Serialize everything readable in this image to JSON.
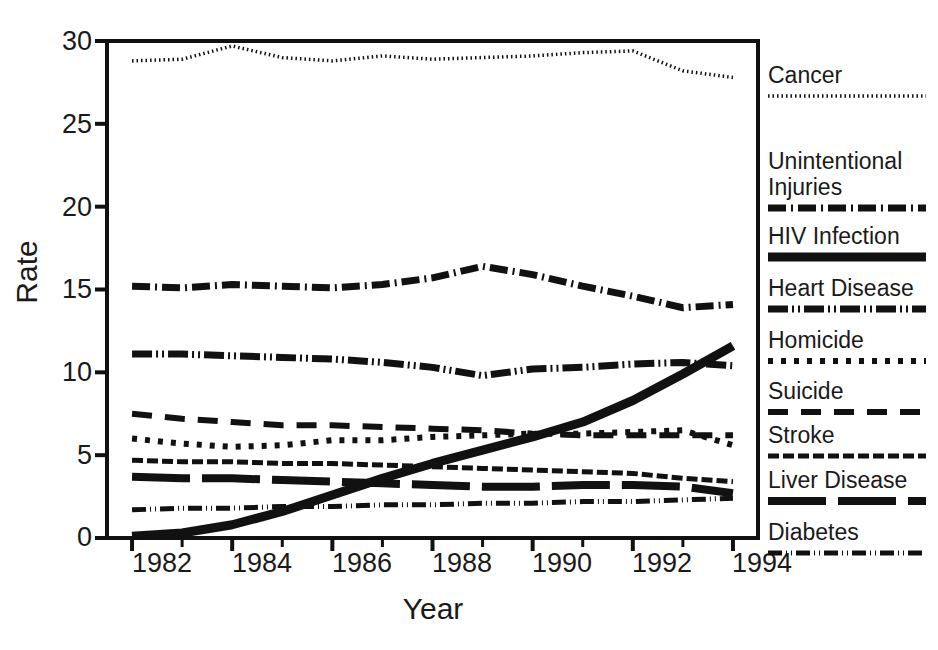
{
  "chart_data": {
    "type": "line",
    "title": "",
    "xlabel": "Year",
    "ylabel": "Rate",
    "xlim": [
      1981.5,
      1994.5
    ],
    "ylim": [
      0,
      30
    ],
    "ytick_values": [
      0,
      5,
      10,
      15,
      20,
      25,
      30
    ],
    "ytick_labels": [
      "0",
      "5",
      "10",
      "15",
      "20",
      "25",
      "30"
    ],
    "xtick_labels": [
      "1982",
      "1984",
      "1986",
      "1988",
      "1990",
      "1992",
      "1994"
    ],
    "xtick_values": [
      1982,
      1984,
      1986,
      1988,
      1990,
      1992,
      1994
    ],
    "minor_xticks": [
      1983,
      1985,
      1987,
      1989,
      1991,
      1993
    ],
    "grid": false,
    "legend_position": "right",
    "x": [
      1982,
      1983,
      1984,
      1985,
      1986,
      1987,
      1988,
      1989,
      1990,
      1991,
      1992,
      1993,
      1994
    ],
    "series": [
      {
        "name": "Cancer",
        "style": "fine-dotted",
        "values": [
          28.8,
          28.9,
          29.7,
          29.0,
          28.8,
          29.1,
          28.9,
          29.0,
          29.1,
          29.3,
          29.4,
          28.2,
          27.8
        ]
      },
      {
        "name": "Unintentional Injuries",
        "style": "dash-dot",
        "values": [
          15.2,
          15.1,
          15.3,
          15.2,
          15.1,
          15.3,
          15.7,
          16.4,
          15.9,
          15.2,
          14.6,
          13.9,
          14.1
        ]
      },
      {
        "name": "HIV Infection",
        "style": "thick-solid",
        "values": [
          0.1,
          0.3,
          0.8,
          1.6,
          2.6,
          3.6,
          4.5,
          5.3,
          6.1,
          7.0,
          8.3,
          9.9,
          11.6
        ]
      },
      {
        "name": "Heart Disease",
        "style": "dash-dot-dot",
        "values": [
          11.1,
          11.1,
          11.0,
          10.9,
          10.8,
          10.6,
          10.3,
          9.8,
          10.2,
          10.3,
          10.5,
          10.6,
          10.4
        ]
      },
      {
        "name": "Homicide",
        "style": "dotted",
        "values": [
          6.0,
          5.7,
          5.5,
          5.6,
          5.9,
          5.9,
          6.1,
          6.2,
          6.3,
          6.3,
          6.4,
          6.5,
          5.6
        ]
      },
      {
        "name": "Suicide",
        "style": "long-dash",
        "values": [
          7.5,
          7.2,
          7.0,
          6.8,
          6.8,
          6.7,
          6.6,
          6.5,
          6.3,
          6.2,
          6.2,
          6.2,
          6.2
        ]
      },
      {
        "name": "Stroke",
        "style": "hatched-dash",
        "values": [
          4.7,
          4.6,
          4.6,
          4.5,
          4.5,
          4.4,
          4.3,
          4.2,
          4.1,
          4.0,
          3.9,
          3.6,
          3.4
        ]
      },
      {
        "name": "Liver Disease",
        "style": "heavy-long-dash",
        "values": [
          3.7,
          3.6,
          3.6,
          3.5,
          3.4,
          3.3,
          3.2,
          3.1,
          3.1,
          3.2,
          3.2,
          3.1,
          2.7
        ]
      },
      {
        "name": "Diabetes",
        "style": "dash-dot-dot-fine",
        "values": [
          1.7,
          1.8,
          1.8,
          1.9,
          1.9,
          2.0,
          2.0,
          2.1,
          2.1,
          2.2,
          2.2,
          2.3,
          2.4
        ]
      }
    ]
  },
  "axes": {
    "y_label": "Rate",
    "x_label": "Year",
    "y_ticks": [
      "30",
      "25",
      "20",
      "15",
      "10",
      "5",
      "0"
    ],
    "x_ticks": [
      "1982",
      "1984",
      "1986",
      "1988",
      "1990",
      "1992",
      "1994"
    ]
  },
  "legend": {
    "entries": [
      {
        "label": "Cancer",
        "label2": "",
        "style": "fine-dotted"
      },
      {
        "label": "Unintentional",
        "label2": "Injuries",
        "style": "dash-dot"
      },
      {
        "label": "HIV Infection",
        "label2": "",
        "style": "thick-solid"
      },
      {
        "label": "Heart Disease",
        "label2": "",
        "style": "dash-dot-dot"
      },
      {
        "label": "Homicide",
        "label2": "",
        "style": "dotted"
      },
      {
        "label": "Suicide",
        "label2": "",
        "style": "long-dash"
      },
      {
        "label": "Stroke",
        "label2": "",
        "style": "hatched-dash"
      },
      {
        "label": "Liver Disease",
        "label2": "",
        "style": "heavy-long-dash"
      },
      {
        "label": "Diabetes",
        "label2": "",
        "style": "dash-dot-dot-fine"
      }
    ]
  },
  "colors": {
    "ink": "#111111",
    "background": "#ffffff"
  }
}
